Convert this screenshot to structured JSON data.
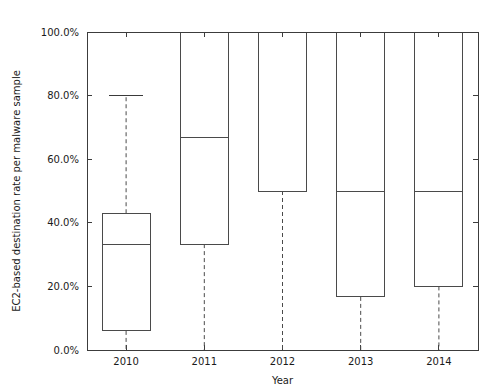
{
  "chart_data": {
    "type": "box",
    "title": "",
    "xlabel": "Year",
    "ylabel": "EC2-based destination rate per malware sample",
    "categories": [
      "2010",
      "2011",
      "2012",
      "2013",
      "2014"
    ],
    "ylim": [
      0,
      100
    ],
    "y_unit": "percent",
    "ytick_labels": [
      "0.0%",
      "20.0%",
      "40.0%",
      "60.0%",
      "80.0%",
      "100.0%"
    ],
    "ytick_values": [
      0,
      20,
      40,
      60,
      80,
      100
    ],
    "xtick_labels": [
      "2010",
      "2011",
      "2012",
      "2013",
      "2014"
    ],
    "grid": false,
    "legend": null,
    "boxes": [
      {
        "category": "2010",
        "whisker_low": 0.0,
        "q1": 6.0,
        "median": 33.3,
        "q3": 43.0,
        "whisker_high": 80.0,
        "has_upper_cap": true,
        "has_lower_cap": false
      },
      {
        "category": "2011",
        "whisker_low": 0.0,
        "q1": 33.3,
        "median": 66.7,
        "q3": 100.0,
        "whisker_high": 100.0,
        "has_upper_cap": false,
        "has_lower_cap": false
      },
      {
        "category": "2012",
        "whisker_low": 0.0,
        "q1": 50.0,
        "median": 50.0,
        "q3": 100.0,
        "whisker_high": 100.0,
        "has_upper_cap": false,
        "has_lower_cap": false
      },
      {
        "category": "2013",
        "whisker_low": 0.0,
        "q1": 16.7,
        "median": 50.0,
        "q3": 100.0,
        "whisker_high": 100.0,
        "has_upper_cap": false,
        "has_lower_cap": false
      },
      {
        "category": "2014",
        "whisker_low": 0.0,
        "q1": 20.0,
        "median": 50.0,
        "q3": 100.0,
        "whisker_high": 100.0,
        "has_upper_cap": false,
        "has_lower_cap": false
      }
    ],
    "colors": {
      "background": "#ffffff",
      "axis": "#3c3c3c",
      "box_stroke": "#4a4a4a",
      "whisker": "#4a4a4a",
      "text": "#1a1a1a"
    }
  }
}
